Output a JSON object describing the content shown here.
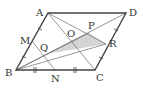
{
  "diagram": {
    "colors": {
      "outline": "#444444",
      "thin": "#666666",
      "shade": "#d4d4d4"
    },
    "points": {
      "A": {
        "label": "A",
        "x": 48,
        "y": 13
      },
      "D": {
        "label": "D",
        "x": 126,
        "y": 13
      },
      "B": {
        "label": "B",
        "x": 16,
        "y": 70
      },
      "C": {
        "label": "C",
        "x": 95,
        "y": 70
      },
      "M": {
        "label": "M",
        "x": 32,
        "y": 41
      },
      "N": {
        "label": "N",
        "x": 55,
        "y": 70
      },
      "O": {
        "label": "O",
        "x": 71,
        "y": 41
      },
      "P": {
        "label": "P",
        "x": 89,
        "y": 33
      },
      "Q": {
        "label": "Q",
        "x": 46,
        "y": 54
      },
      "R": {
        "label": "R",
        "x": 106,
        "y": 44
      }
    },
    "segments": [
      [
        "A",
        "D"
      ],
      [
        "D",
        "C"
      ],
      [
        "C",
        "B"
      ],
      [
        "B",
        "A"
      ],
      [
        "B",
        "D"
      ],
      [
        "A",
        "C"
      ],
      [
        "A",
        "N"
      ],
      [
        "M",
        "C"
      ],
      [
        "B",
        "R"
      ],
      [
        "A",
        "R"
      ]
    ],
    "shaded_region": [
      "Q",
      "P",
      "R"
    ],
    "tick_marks": {
      "AB": "single",
      "BC": "double"
    }
  }
}
